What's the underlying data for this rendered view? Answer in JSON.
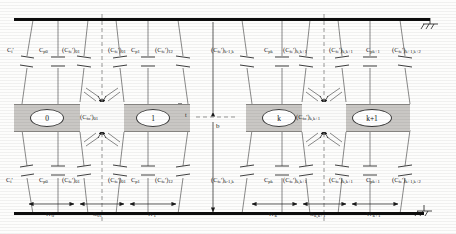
{
  "figure": {
    "type": "equivalent-circuit-diagram",
    "ground_symbol": "hatched-ground"
  },
  "ground_planes": {
    "top_label": "top-ground-plane",
    "bottom_label": "bottom-ground-plane"
  },
  "resonators": [
    {
      "id": "res-0",
      "label": "0"
    },
    {
      "id": "res-1",
      "label": "1"
    },
    {
      "id": "res-k",
      "label": "k"
    },
    {
      "id": "res-k1",
      "label": "k+1"
    }
  ],
  "capacitors_top": [
    {
      "name": "C_i_prime",
      "base": "C",
      "sub": "i",
      "prime": true,
      "paren": false,
      "psub": ""
    },
    {
      "name": "C_p0",
      "base": "C",
      "sub": "p0",
      "prime": false,
      "paren": false,
      "psub": ""
    },
    {
      "name": "Cfe_01_left",
      "base": "C",
      "sub": "fe",
      "prime": true,
      "paren": true,
      "psub": "01"
    },
    {
      "name": "Cfe_01_right",
      "base": "C",
      "sub": "fe",
      "prime": true,
      "paren": true,
      "psub": "01"
    },
    {
      "name": "C_p1",
      "base": "C",
      "sub": "p1",
      "prime": false,
      "paren": false,
      "psub": ""
    },
    {
      "name": "Cfe_12",
      "base": "C",
      "sub": "fe",
      "prime": true,
      "paren": true,
      "psub": "12"
    },
    {
      "name": "Cfe_km1k",
      "base": "C",
      "sub": "fe",
      "prime": true,
      "paren": true,
      "psub": "k-1,k"
    },
    {
      "name": "C_pk",
      "base": "C",
      "sub": "pk",
      "prime": false,
      "paren": false,
      "psub": ""
    },
    {
      "name": "Cfe_kk1_left",
      "base": "C",
      "sub": "fe",
      "prime": true,
      "paren": true,
      "psub": "k,k+1"
    },
    {
      "name": "Cfe_kk1_right",
      "base": "C",
      "sub": "fe",
      "prime": true,
      "paren": true,
      "psub": "k,k+1"
    },
    {
      "name": "C_pk1",
      "base": "C",
      "sub": "pk+1",
      "prime": false,
      "paren": false,
      "psub": ""
    },
    {
      "name": "Cfe_k1k2",
      "base": "C",
      "sub": "fe",
      "prime": true,
      "paren": true,
      "psub": "k+1,k+2"
    }
  ],
  "capacitors_bottom": [
    {
      "name": "C_i_prime",
      "base": "C",
      "sub": "i",
      "prime": true,
      "paren": false,
      "psub": ""
    },
    {
      "name": "C_p0",
      "base": "C",
      "sub": "p0",
      "prime": false,
      "paren": false,
      "psub": ""
    },
    {
      "name": "Cfe_01_left",
      "base": "C",
      "sub": "fe",
      "prime": true,
      "paren": true,
      "psub": "01"
    },
    {
      "name": "Cfe_01_right",
      "base": "C",
      "sub": "fe",
      "prime": true,
      "paren": true,
      "psub": "01"
    },
    {
      "name": "C_p1",
      "base": "C",
      "sub": "p1",
      "prime": false,
      "paren": false,
      "psub": ""
    },
    {
      "name": "Cfe_12",
      "base": "C",
      "sub": "fe",
      "prime": true,
      "paren": true,
      "psub": "12"
    },
    {
      "name": "Cfe_km1k",
      "base": "C",
      "sub": "fe",
      "prime": true,
      "paren": true,
      "psub": "k-1,k"
    },
    {
      "name": "C_pk",
      "base": "C",
      "sub": "pk",
      "prime": false,
      "paren": false,
      "psub": ""
    },
    {
      "name": "Cfe_kk1_left",
      "base": "C",
      "sub": "fe",
      "prime": true,
      "paren": true,
      "psub": "k,k+1"
    },
    {
      "name": "Cfe_kk1_right",
      "base": "C",
      "sub": "fe",
      "prime": true,
      "paren": true,
      "psub": "k,k+1"
    },
    {
      "name": "C_pk1",
      "base": "C",
      "sub": "pk+1",
      "prime": false,
      "paren": false,
      "psub": ""
    },
    {
      "name": "Cfe_k1k2",
      "base": "C",
      "sub": "fe",
      "prime": true,
      "paren": true,
      "psub": "k+1,k+2"
    }
  ],
  "coupling_labels": [
    {
      "name": "Cfo_01",
      "base": "C",
      "sub": "fo",
      "prime": true,
      "psub": "01"
    },
    {
      "name": "Cfo_kk1",
      "base": "C",
      "sub": "fo",
      "prime": true,
      "psub": "k,k+1"
    }
  ],
  "dimensions": [
    {
      "name": "W_0",
      "base": "W",
      "sub": "0"
    },
    {
      "name": "S_01",
      "base": "S",
      "sub": "01"
    },
    {
      "name": "W_1",
      "base": "W",
      "sub": "1"
    },
    {
      "name": "W_k",
      "base": "W",
      "sub": "k"
    },
    {
      "name": "S_kk1",
      "base": "S",
      "sub": "k,k+1"
    },
    {
      "name": "W_k1",
      "base": "W",
      "sub": "k+1"
    },
    {
      "name": "b",
      "base": "b",
      "sub": ""
    },
    {
      "name": "t",
      "base": "t",
      "sub": ""
    }
  ],
  "colors": {
    "ground": "#0d0d0d",
    "resonator_fill": "#c9c7c4",
    "line": "#4a4a4a",
    "dashed": "#6b6b6b",
    "text": "#1a1a1a"
  }
}
